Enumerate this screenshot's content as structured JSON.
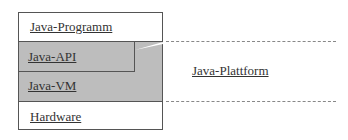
{
  "diagram": {
    "layers": {
      "program": "Java-Programm",
      "api": "Java-API",
      "vm": "Java-VM",
      "hardware": "Hardware"
    },
    "platform_label": "Java-Plattform",
    "colors": {
      "platform_fill": "#bdbdbd",
      "border": "#555555",
      "text": "#333333"
    }
  }
}
